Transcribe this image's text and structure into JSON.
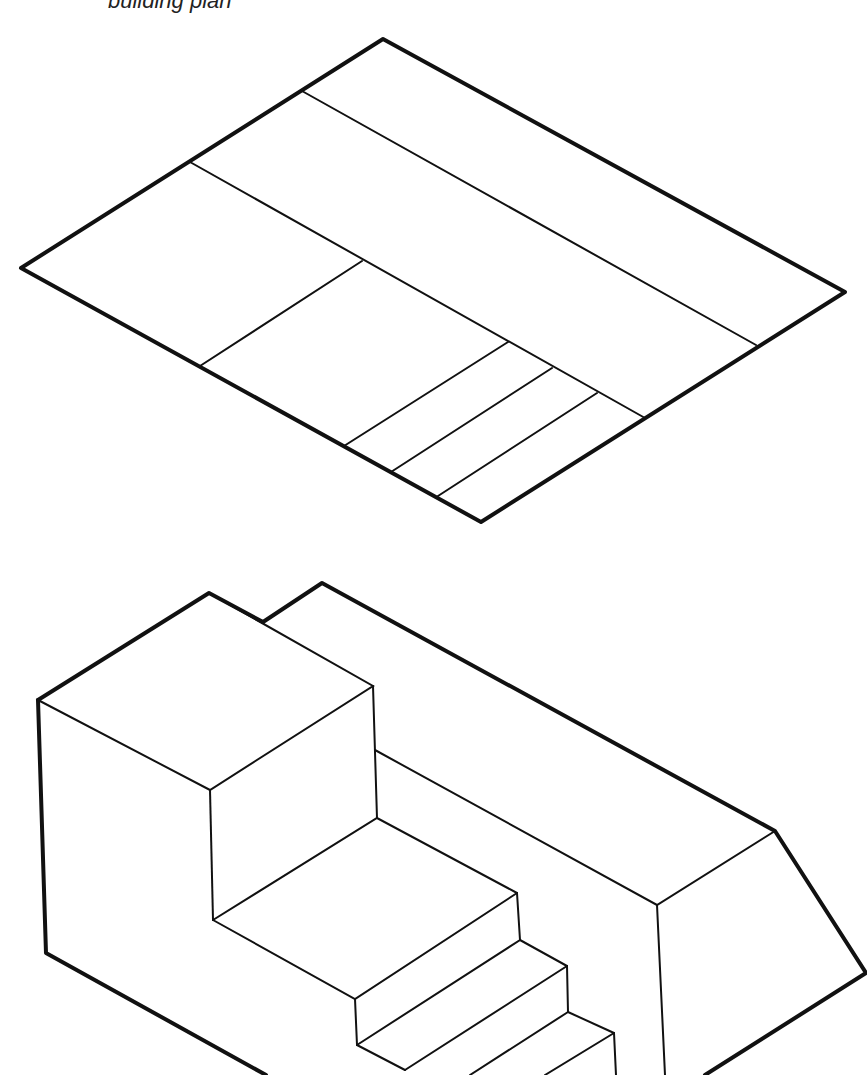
{
  "caption": "building plan",
  "colors": {
    "ink": "#111111",
    "background": "#ffffff"
  },
  "plan_view": {
    "description": "isometric floor plan outline with room divisions and three stair treads",
    "outline": [
      [
        383,
        39
      ],
      [
        845,
        292
      ],
      [
        481,
        522
      ],
      [
        21,
        268
      ]
    ],
    "thin_lines": [
      [
        [
          302,
          91
        ],
        [
          756,
          345
        ]
      ],
      [
        [
          190,
          162
        ],
        [
          645,
          418
        ]
      ],
      [
        [
          362,
          261
        ],
        [
          200,
          366
        ]
      ],
      [
        [
          508,
          342
        ],
        [
          344,
          446
        ]
      ],
      [
        [
          552,
          368
        ],
        [
          391,
          472
        ]
      ],
      [
        [
          597,
          393
        ],
        [
          438,
          496
        ]
      ]
    ]
  },
  "isometric_view": {
    "description": "3D isometric block with tall section, stepped stairs and long sloped wing",
    "thick_lines": [
      [
        [
          38,
          700
        ],
        [
          209,
          593
        ],
        [
          263,
          622
        ]
      ],
      [
        [
          263,
          622
        ],
        [
          322,
          583
        ],
        [
          775,
          831
        ],
        [
          866,
          973
        ],
        [
          705,
          1075
        ]
      ],
      [
        [
          38,
          700
        ],
        [
          46,
          953
        ],
        [
          266,
          1075
        ]
      ]
    ],
    "thin_lines": [
      [
        [
          38,
          700
        ],
        [
          210,
          790
        ],
        [
          373,
          686
        ],
        [
          209,
          593
        ]
      ],
      [
        [
          373,
          686
        ],
        [
          377,
          818
        ]
      ],
      [
        [
          375,
          750
        ],
        [
          657,
          905
        ],
        [
          775,
          831
        ]
      ],
      [
        [
          657,
          905
        ],
        [
          665,
          1075
        ]
      ],
      [
        [
          210,
          790
        ],
        [
          213,
          920
        ]
      ],
      [
        [
          213,
          920
        ],
        [
          377,
          818
        ],
        [
          517,
          893
        ]
      ],
      [
        [
          213,
          920
        ],
        [
          355,
          999
        ],
        [
          517,
          893
        ]
      ],
      [
        [
          355,
          999
        ],
        [
          357,
          1045
        ]
      ],
      [
        [
          357,
          1045
        ],
        [
          520,
          940
        ],
        [
          517,
          893
        ]
      ],
      [
        [
          357,
          1045
        ],
        [
          405,
          1070
        ]
      ],
      [
        [
          520,
          940
        ],
        [
          567,
          966
        ]
      ],
      [
        [
          405,
          1070
        ],
        [
          567,
          966
        ]
      ],
      [
        [
          567,
          966
        ],
        [
          568,
          1012
        ]
      ],
      [
        [
          568,
          1012
        ],
        [
          614,
          1033
        ]
      ],
      [
        [
          614,
          1033
        ],
        [
          616,
          1075
        ]
      ],
      [
        [
          568,
          1012
        ],
        [
          470,
          1075
        ]
      ],
      [
        [
          614,
          1033
        ],
        [
          545,
          1075
        ]
      ]
    ]
  }
}
